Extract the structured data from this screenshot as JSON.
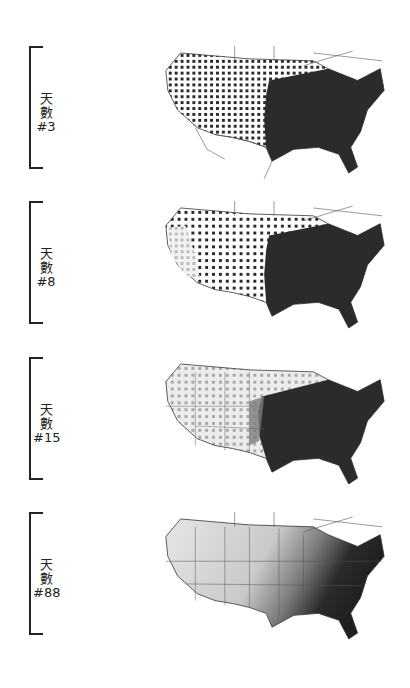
{
  "figure": {
    "panels": [
      {
        "label_line1": "天",
        "label_line2": "數",
        "day_label": "#3",
        "day": 3,
        "fill_level": "dense dots nationwide, solid east"
      },
      {
        "label_line1": "天",
        "label_line2": "數",
        "day_label": "#8",
        "day": 8,
        "fill_level": "west coast lightening, east solid"
      },
      {
        "label_line1": "天",
        "label_line2": "數",
        "day_label": "#15",
        "day": 15,
        "fill_level": "west mostly light gray, east dark"
      },
      {
        "label_line1": "天",
        "label_line2": "數",
        "day_label": "#88",
        "day": 88,
        "fill_level": "gradient light west to dark southeast"
      }
    ]
  },
  "colors": {
    "background": "#ffffff",
    "dark": "#2b2b2b",
    "mid": "#7a7a7a",
    "light": "#c8c8c8",
    "border": "#333333"
  }
}
